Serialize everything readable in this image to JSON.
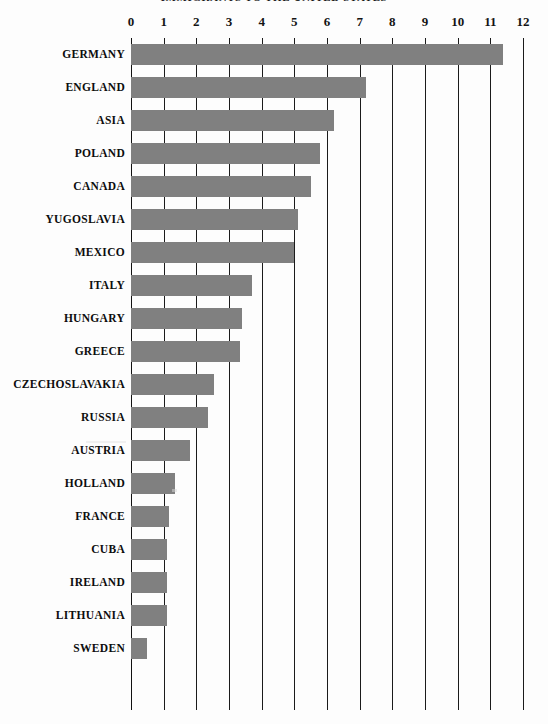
{
  "chart": {
    "title": "IMMIGRANTS TO THE UNITED STATES",
    "axis": {
      "x_ticks": [
        "0",
        "1",
        "2",
        "3",
        "4",
        "5",
        "6",
        "7",
        "8",
        "9",
        "10",
        "11",
        "12"
      ],
      "x_min": 0,
      "x_max": 12,
      "grid": true,
      "bar_color": "#808080",
      "line_color": "#1b1b1b"
    }
  },
  "chart_data": {
    "type": "bar",
    "orientation": "horizontal",
    "title": "IMMIGRANTS TO THE UNITED STATES",
    "xlabel": "",
    "ylabel": "",
    "xlim": [
      0,
      12
    ],
    "grid": true,
    "legend": "none",
    "categories": [
      "GERMANY",
      "ENGLAND",
      "ASIA",
      "POLAND",
      "CANADA",
      "YUGOSLAVIA",
      "MEXICO",
      "ITALY",
      "HUNGARY",
      "GREECE",
      "CZECHOSLAVAKIA",
      "RUSSIA",
      "AUSTRIA",
      "HOLLAND",
      "FRANCE",
      "CUBA",
      "IRELAND",
      "LITHUANIA",
      "SWEDEN"
    ],
    "values": [
      11.4,
      7.2,
      6.2,
      5.8,
      5.5,
      5.1,
      5.0,
      3.7,
      3.4,
      3.35,
      2.55,
      2.35,
      1.8,
      1.35,
      1.15,
      1.1,
      1.1,
      1.1,
      0.5
    ],
    "tick_values": [
      0,
      1,
      2,
      3,
      4,
      5,
      6,
      7,
      8,
      9,
      10,
      11,
      12
    ],
    "tick_labels": [
      "0",
      "1",
      "2",
      "3",
      "4",
      "5",
      "6",
      "7",
      "8",
      "9",
      "10",
      "11",
      "12"
    ]
  }
}
